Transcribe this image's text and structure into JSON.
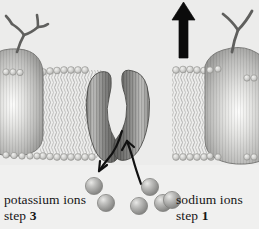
{
  "figure": {
    "background_color": "#ececeb"
  },
  "labels": {
    "potassium": {
      "name": "potassium ions",
      "step_word": "step",
      "step_number": "3"
    },
    "sodium": {
      "name": "sodium ions",
      "step_word": "step",
      "step_number": "1"
    }
  },
  "colors": {
    "membrane_protein_light": "#d2d2d0",
    "membrane_protein_mid": "#a8a8a6",
    "membrane_protein_dark": "#6e6e6c",
    "channel_dark": "#707070",
    "ion_fill": "#9a9a98",
    "ion_highlight": "#d8d8d6",
    "arrow_black": "#0b0b0b",
    "carbohydrate": "#5f5f5d",
    "lipid_head": "#c9c9c7",
    "lipid_tail": "#b4b4b2",
    "text": "#151515"
  },
  "diagram": {
    "transport_arrow": {
      "direction": "up",
      "meaning": "sodium ions exported out of cell"
    },
    "channel_arrows": [
      {
        "direction": "down-left",
        "meaning": "potassium ions released inside"
      },
      {
        "direction": "up-right",
        "meaning": "sodium ions drawn into channel"
      }
    ],
    "ions": {
      "potassium_group_count": 2,
      "sodium_group_count": 3,
      "total_visible": 6
    },
    "membrane": {
      "type": "phospholipid bilayer",
      "leaflets": 2
    },
    "proteins": {
      "left_integral_protein": "glycoprotein with branched carbohydrate",
      "right_integral_protein": "glycoprotein with Y-shaped carbohydrate",
      "center_channel": "two-subunit transport protein, open gate"
    }
  }
}
